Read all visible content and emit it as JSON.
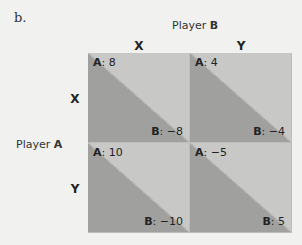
{
  "figure_label": "b.",
  "player_b": {
    "prefix": "Player ",
    "name": "B"
  },
  "player_a": {
    "prefix": "Player ",
    "name": "A"
  },
  "columns": [
    "X",
    "Y"
  ],
  "rows": [
    "X",
    "Y"
  ],
  "cells": [
    {
      "a_key": "A",
      "a_val": ": 8",
      "b_key": "B",
      "b_val": ": −8"
    },
    {
      "a_key": "A",
      "a_val": ": 4",
      "b_key": "B",
      "b_val": ": −4"
    },
    {
      "a_key": "A",
      "a_val": ": 10",
      "b_key": "B",
      "b_val": ": −10"
    },
    {
      "a_key": "A",
      "a_val": ": −5",
      "b_key": "B",
      "b_val": ": 5"
    }
  ],
  "colors": {
    "dark_triangle": "#a0a09e",
    "light_triangle": "#c8c8c6",
    "background": "#f1f1f0"
  }
}
